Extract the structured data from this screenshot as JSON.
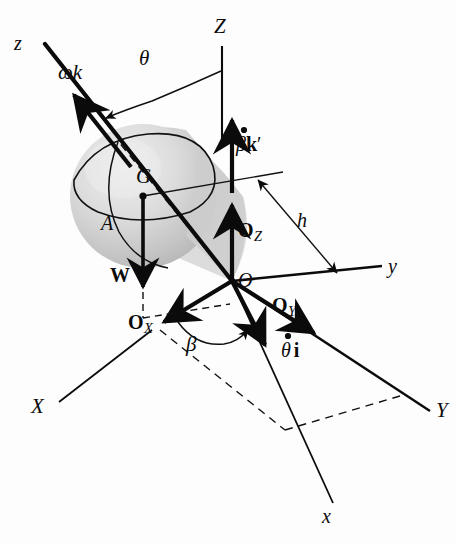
{
  "figure": {
    "kind": "engineering-mechanics-diagram",
    "background_color": "#fdfdfd",
    "ink_color": "#0b0b0b",
    "body_fill_light": "#e6e6e6",
    "body_fill_mid": "#cfcfcf",
    "body_fill_dark": "#bdbdbd"
  },
  "labels": {
    "axis_Z": "Z",
    "axis_Y": "Y",
    "axis_X": "X",
    "axis_y": "y",
    "axis_x": "x",
    "axis_z": "z",
    "origin": "O",
    "point_G": "G",
    "point_A": "A",
    "weight": "W",
    "spin_vector": "ωk",
    "precession_vector_beta": "β",
    "precession_vector_unit": "k",
    "precession_prime": "′",
    "nutation_vector_theta": "θ",
    "nutation_vector_unit": "i",
    "reaction_Z": "O",
    "reaction_Z_sub": "Z",
    "reaction_Y": "O",
    "reaction_Y_sub": "Y",
    "reaction_X": "O",
    "reaction_X_sub": "X",
    "height_h": "h",
    "angle_theta": "θ",
    "angle_beta": "β"
  },
  "geometry": {
    "origin_point": [
      232,
      281
    ],
    "center_of_mass_G": [
      143,
      196
    ],
    "axis_z_tip": [
      40,
      38
    ],
    "axis_Z_top": [
      222,
      44
    ],
    "axis_y_tip": [
      383,
      268
    ],
    "axis_Y_tip": [
      432,
      410
    ],
    "axis_X_tip": [
      58,
      404
    ],
    "axis_x_tip": [
      340,
      505
    ],
    "h_arrow_start": [
      255,
      175
    ],
    "h_arrow_end": [
      336,
      271
    ],
    "theta_arc_label": [
      150,
      60
    ],
    "beta_arc_label": [
      192,
      345
    ]
  }
}
